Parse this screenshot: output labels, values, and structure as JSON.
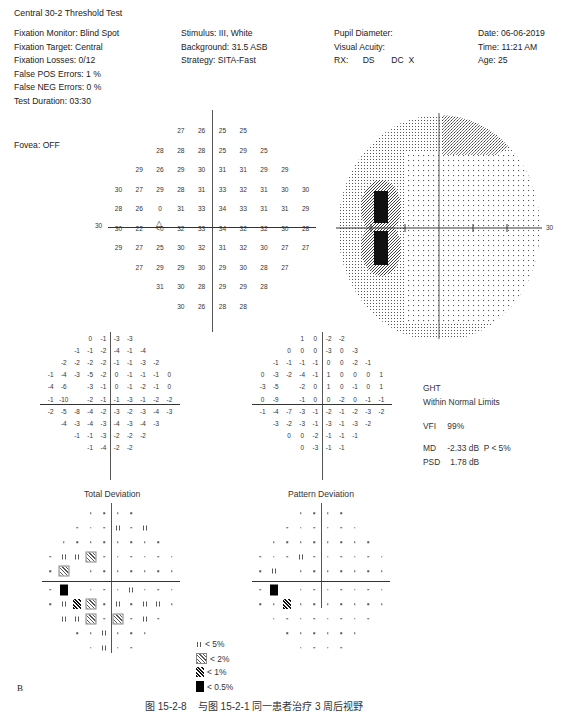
{
  "report": {
    "title": "Central 30-2 Threshold Test",
    "col1": [
      "Fixation Monitor: Blind Spot",
      "Fixation Target: Central",
      "Fixation Losses: 0/12",
      "False POS Errors:   1 %",
      "False NEG Errors:   0 %",
      "Test Duration: 03:30"
    ],
    "fovea": "Fovea: OFF",
    "col2": [
      "Stimulus: III, White",
      "Background: 31.5 ASB",
      "Strategy: SITA-Fast"
    ],
    "col3": [
      "Pupil Diameter:",
      "Visual Acuity:",
      "RX:      DS       DC  X"
    ],
    "col4": [
      "Date: 06-06-2019",
      "Time: 11:21 AM",
      "Age: 25"
    ]
  },
  "threshold_map": {
    "axis_label_left": "30",
    "blind_spot_marker": "△",
    "rows": [
      {
        "cols": [
          -2,
          -1,
          1,
          2
        ],
        "values": [
          "27",
          "26",
          "25",
          "25"
        ]
      },
      {
        "cols": [
          -3,
          -2,
          -1,
          1,
          2,
          3
        ],
        "values": [
          "28",
          "28",
          "28",
          "25",
          "29",
          "25"
        ]
      },
      {
        "cols": [
          -4,
          -3,
          -2,
          -1,
          1,
          2,
          3,
          4
        ],
        "values": [
          "29",
          "26",
          "29",
          "30",
          "31",
          "31",
          "29",
          "29"
        ]
      },
      {
        "cols": [
          -5,
          -4,
          -3,
          -2,
          -1,
          1,
          2,
          3,
          4,
          5
        ],
        "values": [
          "30",
          "27",
          "29",
          "28",
          "31",
          "33",
          "32",
          "31",
          "30",
          "30"
        ]
      },
      {
        "cols": [
          -5,
          -4,
          -3,
          -2,
          -1,
          1,
          2,
          3,
          4,
          5
        ],
        "values": [
          "28",
          "26",
          "0",
          "31",
          "33",
          "34",
          "33",
          "31",
          "31",
          "29"
        ]
      },
      {
        "cols": [
          -5,
          -4,
          -3,
          -2,
          -1,
          1,
          2,
          3,
          4,
          5
        ],
        "values": [
          "30",
          "22",
          "<0",
          "32",
          "33",
          "34",
          "32",
          "32",
          "30",
          "28"
        ]
      },
      {
        "cols": [
          -5,
          -4,
          -3,
          -2,
          -1,
          1,
          2,
          3,
          4,
          5
        ],
        "values": [
          "29",
          "27",
          "25",
          "30",
          "32",
          "31",
          "32",
          "30",
          "27",
          "27"
        ]
      },
      {
        "cols": [
          -4,
          -3,
          -2,
          -1,
          1,
          2,
          3,
          4
        ],
        "values": [
          "27",
          "29",
          "29",
          "30",
          "29",
          "30",
          "28",
          "27"
        ]
      },
      {
        "cols": [
          -3,
          -2,
          -1,
          1,
          2,
          3
        ],
        "values": [
          "31",
          "30",
          "28",
          "29",
          "29",
          "28"
        ]
      },
      {
        "cols": [
          -2,
          -1,
          1,
          2
        ],
        "values": [
          "30",
          "26",
          "28",
          "28"
        ]
      }
    ]
  },
  "greyscale": {
    "axis_label_right": "30"
  },
  "total_deviation": {
    "label": "Total Deviation",
    "rows": [
      {
        "cols": [
          -2,
          -1,
          1,
          2
        ],
        "values": [
          "0",
          "-1",
          "-3",
          "-3"
        ]
      },
      {
        "cols": [
          -3,
          -2,
          -1,
          1,
          2,
          3
        ],
        "values": [
          "-1",
          "-1",
          "-2",
          "-4",
          "-1",
          "-4"
        ]
      },
      {
        "cols": [
          -4,
          -3,
          -2,
          -1,
          1,
          2,
          3,
          4
        ],
        "values": [
          "-2",
          "-2",
          "-2",
          "-2",
          "-1",
          "-1",
          "-3",
          "-2"
        ]
      },
      {
        "cols": [
          -5,
          -4,
          -3,
          -2,
          -1,
          1,
          2,
          3,
          4,
          5
        ],
        "values": [
          "-1",
          "-4",
          "-3",
          "-5",
          "-2",
          "0",
          "-1",
          "-1",
          "-1",
          "0"
        ]
      },
      {
        "cols": [
          -5,
          -4,
          -2,
          -1,
          1,
          2,
          3,
          4,
          5
        ],
        "values": [
          "-4",
          "-6",
          "-3",
          "-1",
          "0",
          "-1",
          "-2",
          "-1",
          "0"
        ]
      },
      {
        "cols": [
          -5,
          -4,
          -2,
          -1,
          1,
          2,
          3,
          4,
          5
        ],
        "values": [
          "-1",
          "-10",
          "-2",
          "-1",
          "-1",
          "-3",
          "-1",
          "-2",
          "-2"
        ]
      },
      {
        "cols": [
          -5,
          -4,
          -3,
          -2,
          -1,
          1,
          2,
          3,
          4,
          5
        ],
        "values": [
          "-2",
          "-5",
          "-8",
          "-4",
          "-2",
          "-3",
          "-2",
          "-3",
          "-4",
          "-3"
        ]
      },
      {
        "cols": [
          -4,
          -3,
          -2,
          -1,
          1,
          2,
          3,
          4
        ],
        "values": [
          "-4",
          "-3",
          "-4",
          "-3",
          "-4",
          "-3",
          "-4",
          "-3"
        ]
      },
      {
        "cols": [
          -3,
          -2,
          -1,
          1,
          2,
          3
        ],
        "values": [
          "-1",
          "-1",
          "-3",
          "-2",
          "-2",
          "-2"
        ]
      },
      {
        "cols": [
          -2,
          -1,
          1,
          2
        ],
        "values": [
          "-1",
          "-4",
          "-2",
          "-2"
        ]
      }
    ],
    "prob_rows": [
      {
        "cols": [
          -2,
          -1,
          1,
          2
        ],
        "symbols": [
          "n",
          "n",
          "n",
          "n"
        ]
      },
      {
        "cols": [
          -3,
          -2,
          -1,
          1,
          2,
          3
        ],
        "symbols": [
          "n",
          "n",
          "n",
          "p5",
          "n",
          "p5"
        ]
      },
      {
        "cols": [
          -4,
          -3,
          -2,
          -1,
          1,
          2,
          3,
          4
        ],
        "symbols": [
          "n",
          "n",
          "n",
          "n",
          "n",
          "n",
          "n",
          "n"
        ]
      },
      {
        "cols": [
          -5,
          -4,
          -3,
          -2,
          -1,
          1,
          2,
          3,
          4,
          5
        ],
        "symbols": [
          "n",
          "p5",
          "p5",
          "p2",
          "n",
          "n",
          "n",
          "n",
          "n",
          "n"
        ]
      },
      {
        "cols": [
          -5,
          -4,
          -2,
          -1,
          1,
          2,
          3,
          4,
          5
        ],
        "symbols": [
          "n",
          "p2",
          "n",
          "n",
          "n",
          "n",
          "n",
          "n",
          "n"
        ]
      },
      {
        "cols": [
          -5,
          -4,
          -2,
          -1,
          1,
          2,
          3,
          4,
          5
        ],
        "symbols": [
          "n",
          "p05",
          "n",
          "n",
          "n",
          "p5",
          "n",
          "n",
          "n"
        ]
      },
      {
        "cols": [
          -5,
          -4,
          -3,
          -2,
          -1,
          1,
          2,
          3,
          4,
          5
        ],
        "symbols": [
          "n",
          "p5",
          "p1",
          "p2",
          "n",
          "p5",
          "n",
          "p5",
          "p5",
          "n"
        ]
      },
      {
        "cols": [
          -4,
          -3,
          -2,
          -1,
          1,
          2,
          3,
          4
        ],
        "symbols": [
          "p5",
          "p5",
          "p2",
          "n",
          "p2",
          "n",
          "p5",
          "n"
        ]
      },
      {
        "cols": [
          -3,
          -2,
          -1,
          1,
          2,
          3
        ],
        "symbols": [
          "n",
          "n",
          "p5",
          "n",
          "n",
          "n"
        ]
      },
      {
        "cols": [
          -2,
          -1,
          1,
          2
        ],
        "symbols": [
          "n",
          "p5",
          "n",
          "n"
        ]
      }
    ]
  },
  "pattern_deviation": {
    "label": "Pattern Deviation",
    "rows": [
      {
        "cols": [
          -2,
          -1,
          1,
          2
        ],
        "values": [
          "1",
          "0",
          "-2",
          "-2"
        ]
      },
      {
        "cols": [
          -3,
          -2,
          -1,
          1,
          2,
          3
        ],
        "values": [
          "0",
          "0",
          "0",
          "-3",
          "0",
          "-3"
        ]
      },
      {
        "cols": [
          -4,
          -3,
          -2,
          -1,
          1,
          2,
          3,
          4
        ],
        "values": [
          "-1",
          "-1",
          "-1",
          "-1",
          "0",
          "0",
          "-2",
          "-1"
        ]
      },
      {
        "cols": [
          -5,
          -4,
          -3,
          -2,
          -1,
          1,
          2,
          3,
          4,
          5
        ],
        "values": [
          "0",
          "-3",
          "-2",
          "-4",
          "-1",
          "1",
          "0",
          "0",
          "0",
          "1"
        ]
      },
      {
        "cols": [
          -5,
          -4,
          -2,
          -1,
          1,
          2,
          3,
          4,
          5
        ],
        "values": [
          "-3",
          "-5",
          "-2",
          "0",
          "1",
          "0",
          "-1",
          "0",
          "1"
        ]
      },
      {
        "cols": [
          -5,
          -4,
          -2,
          -1,
          1,
          2,
          3,
          4,
          5
        ],
        "values": [
          "0",
          "-9",
          "-1",
          "0",
          "0",
          "-2",
          "0",
          "-1",
          "-1"
        ]
      },
      {
        "cols": [
          -5,
          -4,
          -3,
          -2,
          -1,
          1,
          2,
          3,
          4,
          5
        ],
        "values": [
          "-1",
          "-4",
          "-7",
          "-3",
          "-1",
          "-2",
          "-1",
          "-2",
          "-3",
          "-2"
        ]
      },
      {
        "cols": [
          -4,
          -3,
          -2,
          -1,
          1,
          2,
          3,
          4
        ],
        "values": [
          "-3",
          "-2",
          "-3",
          "-1",
          "-3",
          "-1",
          "-3",
          "-2"
        ]
      },
      {
        "cols": [
          -3,
          -2,
          -1,
          1,
          2,
          3
        ],
        "values": [
          "0",
          "0",
          "-2",
          "-1",
          "-1",
          "-1"
        ]
      },
      {
        "cols": [
          -2,
          -1,
          1,
          2
        ],
        "values": [
          "0",
          "-3",
          "-1",
          "-1"
        ]
      }
    ],
    "prob_rows": [
      {
        "cols": [
          -2,
          -1,
          1,
          2
        ],
        "symbols": [
          "n",
          "n",
          "n",
          "n"
        ]
      },
      {
        "cols": [
          -3,
          -2,
          -1,
          1,
          2,
          3
        ],
        "symbols": [
          "n",
          "n",
          "n",
          "n",
          "n",
          "n"
        ]
      },
      {
        "cols": [
          -4,
          -3,
          -2,
          -1,
          1,
          2,
          3,
          4
        ],
        "symbols": [
          "n",
          "n",
          "n",
          "n",
          "n",
          "n",
          "n",
          "n"
        ]
      },
      {
        "cols": [
          -5,
          -4,
          -3,
          -2,
          -1,
          1,
          2,
          3,
          4,
          5
        ],
        "symbols": [
          "n",
          "n",
          "n",
          "p5",
          "n",
          "n",
          "n",
          "n",
          "n",
          "n"
        ]
      },
      {
        "cols": [
          -5,
          -4,
          -2,
          -1,
          1,
          2,
          3,
          4,
          5
        ],
        "symbols": [
          "n",
          "p5",
          "n",
          "n",
          "n",
          "n",
          "n",
          "n",
          "n"
        ]
      },
      {
        "cols": [
          -5,
          -4,
          -2,
          -1,
          1,
          2,
          3,
          4,
          5
        ],
        "symbols": [
          "n",
          "p05",
          "n",
          "n",
          "n",
          "n",
          "n",
          "n",
          "n"
        ]
      },
      {
        "cols": [
          -5,
          -4,
          -3,
          -2,
          -1,
          1,
          2,
          3,
          4,
          5
        ],
        "symbols": [
          "n",
          "n",
          "p1",
          "n",
          "n",
          "n",
          "n",
          "n",
          "n",
          "n"
        ]
      },
      {
        "cols": [
          -4,
          -3,
          -2,
          -1,
          1,
          2,
          3,
          4
        ],
        "symbols": [
          "n",
          "n",
          "n",
          "n",
          "n",
          "n",
          "n",
          "n"
        ]
      },
      {
        "cols": [
          -3,
          -2,
          -1,
          1,
          2,
          3
        ],
        "symbols": [
          "n",
          "n",
          "n",
          "n",
          "n",
          "n"
        ]
      },
      {
        "cols": [
          -2,
          -1,
          1,
          2
        ],
        "symbols": [
          "n",
          "n",
          "n",
          "n"
        ]
      }
    ]
  },
  "stats": {
    "ght_label": "GHT",
    "ght_value": "Within Normal Limits",
    "vfi_label": "VFI",
    "vfi_value": "99%",
    "md_label": "MD",
    "md_value": "-2.33 dB  P < 5%",
    "psd_label": "PSD",
    "psd_value": "1.78 dB"
  },
  "legend": [
    {
      "symbol": "p5",
      "label": "< 5%"
    },
    {
      "symbol": "p2",
      "label": "< 2%"
    },
    {
      "symbol": "p1",
      "label": "< 1%"
    },
    {
      "symbol": "p05",
      "label": "< 0.5%"
    }
  ],
  "panel_letter": "B",
  "caption": "图 15-2-8    与图 15-2-1 同一患者治疗 3 周后视野"
}
